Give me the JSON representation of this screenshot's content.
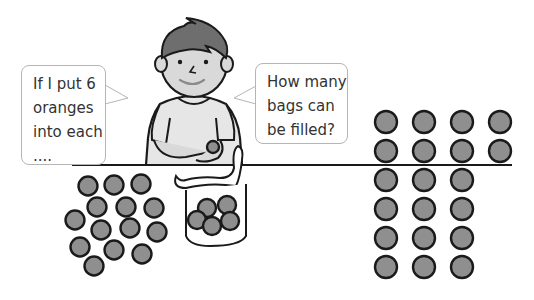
{
  "scene": {
    "description": "Boy at a table with a bag of oranges and speech bubbles",
    "bubble_left": {
      "lines": [
        "If I put 6",
        "oranges",
        "into each",
        "...."
      ]
    },
    "bubble_right": {
      "lines": [
        "How many",
        "bags can",
        "be filled?"
      ]
    },
    "counts": {
      "oranges_on_table": 14,
      "oranges_in_bag": 5,
      "oranges_in_hand": 1,
      "grid_columns": [
        6,
        6,
        6,
        2
      ],
      "grid_total": 20
    },
    "colors": {
      "orange_fill": "#8f8f8f",
      "outline": "#1a1a1a",
      "hair": "#6e6e6e",
      "skin": "#d9d9d9",
      "bubble_border": "#b5b5b5"
    }
  }
}
